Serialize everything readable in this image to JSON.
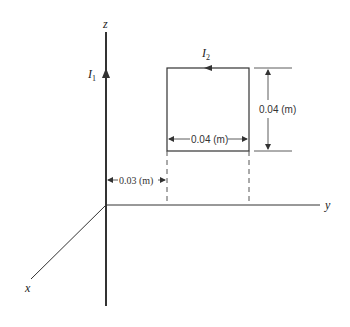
{
  "diagram": {
    "axes": {
      "z_label": "z",
      "y_label": "y",
      "x_label": "x"
    },
    "wire": {
      "current_label": "I",
      "current_subscript": "1"
    },
    "loop": {
      "current_label": "I",
      "current_subscript": "2",
      "width_label": "0.04 (m)",
      "height_label": "0.04 (m)"
    },
    "separation": {
      "label": "0.03 (m)"
    },
    "colors": {
      "line": "#333333",
      "background": "#ffffff"
    }
  }
}
